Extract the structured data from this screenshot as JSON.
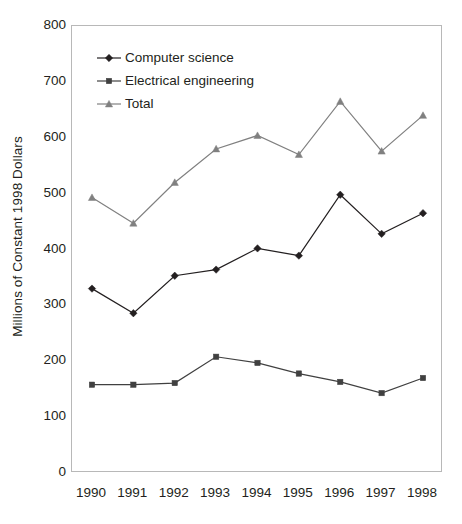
{
  "chart_data": {
    "type": "line",
    "title": "",
    "xlabel": "",
    "ylabel": "Millions of Constant 1998 Dollars",
    "categories": [
      "1990",
      "1991",
      "1992",
      "1993",
      "1994",
      "1995",
      "1996",
      "1997",
      "1998"
    ],
    "x": [
      1990,
      1991,
      1992,
      1993,
      1994,
      1995,
      1996,
      1997,
      1998
    ],
    "ylim": [
      0,
      800
    ],
    "yticks": [
      0,
      100,
      200,
      300,
      400,
      500,
      600,
      700,
      800
    ],
    "grid": false,
    "legend_position": "top-left-inside",
    "series": [
      {
        "name": "Computer science",
        "marker": "diamond",
        "color": "#231f20",
        "values": [
          330,
          286,
          353,
          364,
          402,
          389,
          498,
          428,
          465
        ]
      },
      {
        "name": "Electrical engineering",
        "marker": "square",
        "color": "#404040",
        "values": [
          158,
          158,
          161,
          208,
          197,
          178,
          163,
          143,
          170
        ]
      },
      {
        "name": "Total",
        "marker": "triangle",
        "color": "#808080",
        "values": [
          493,
          447,
          520,
          580,
          604,
          570,
          665,
          576,
          640
        ]
      }
    ]
  },
  "axis": {
    "y_tick_labels": [
      "800",
      "700",
      "600",
      "500",
      "400",
      "300",
      "200",
      "100",
      "0"
    ],
    "x_tick_labels": [
      "1990",
      "1991",
      "1992",
      "1993",
      "1994",
      "1995",
      "1996",
      "1997",
      "1998"
    ],
    "y_axis_title": "Millions of Constant 1998 Dollars"
  },
  "legend": {
    "items": [
      {
        "label": "Computer science",
        "marker": "diamond-marker",
        "color": "#231f20"
      },
      {
        "label": "Electrical engineering",
        "marker": "square-marker",
        "color": "#404040"
      },
      {
        "label": "Total",
        "marker": "triangle-marker",
        "color": "#808080"
      }
    ]
  }
}
